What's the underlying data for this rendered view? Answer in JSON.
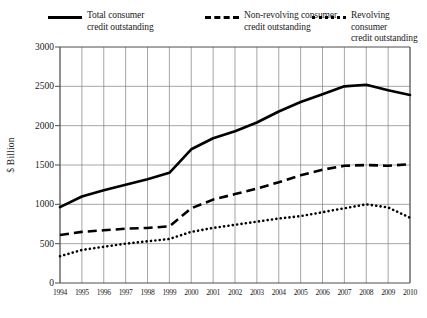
{
  "chart_data": {
    "type": "line",
    "title": "",
    "subtitle": "",
    "xlabel": "",
    "ylabel": "$ Billion",
    "xlim": [
      1994,
      2010
    ],
    "ylim": [
      0,
      3000
    ],
    "grid": true,
    "legend_position": "top",
    "x": [
      1994,
      1995,
      1996,
      1997,
      1998,
      1999,
      2000,
      2001,
      2002,
      2003,
      2004,
      2005,
      2006,
      2007,
      2008,
      2009,
      2010
    ],
    "xtick_labels": [
      "1994",
      "1995",
      "1996",
      "1997",
      "1998",
      "1999",
      "2000",
      "2001",
      "2002",
      "2003",
      "2004",
      "2005",
      "2006",
      "2007",
      "2008",
      "2009",
      "2010"
    ],
    "ytick_values": [
      0,
      500,
      1000,
      1500,
      2000,
      2500,
      3000
    ],
    "ytick_labels": [
      "0",
      "500",
      "1000",
      "1500",
      "2000",
      "2500",
      "3000"
    ],
    "series": [
      {
        "name": "Total consumer credit outstanding",
        "style": "solid",
        "color": "#000000",
        "values": [
          965,
          1100,
          1180,
          1250,
          1320,
          1400,
          1700,
          1840,
          1930,
          2040,
          2180,
          2300,
          2400,
          2500,
          2520,
          2450,
          2390
        ]
      },
      {
        "name": "Non-revolving consumer credit outstanding",
        "style": "dashed",
        "color": "#000000",
        "values": [
          610,
          650,
          670,
          690,
          700,
          720,
          950,
          1060,
          1130,
          1200,
          1280,
          1370,
          1440,
          1490,
          1500,
          1490,
          1510
        ]
      },
      {
        "name": "Revolving consumer credit outstanding",
        "style": "dotted",
        "color": "#000000",
        "values": [
          340,
          420,
          460,
          500,
          530,
          560,
          650,
          700,
          740,
          780,
          820,
          850,
          900,
          950,
          1000,
          960,
          830
        ]
      }
    ]
  },
  "legend": {
    "entries": [
      {
        "label": "Total consumer\ncredit outstanding",
        "style": "solid"
      },
      {
        "label": "Non-revolving consumer\ncredit outstanding",
        "style": "dashed"
      },
      {
        "label": "Revolving consumer\ncredit outstanding",
        "style": "dotted"
      }
    ]
  },
  "axes": {
    "y_axis_title": "$ Billion"
  },
  "colors": {
    "line": "#000000",
    "grid": "#808080",
    "axis": "#4d4d4d",
    "background": "#ffffff"
  }
}
